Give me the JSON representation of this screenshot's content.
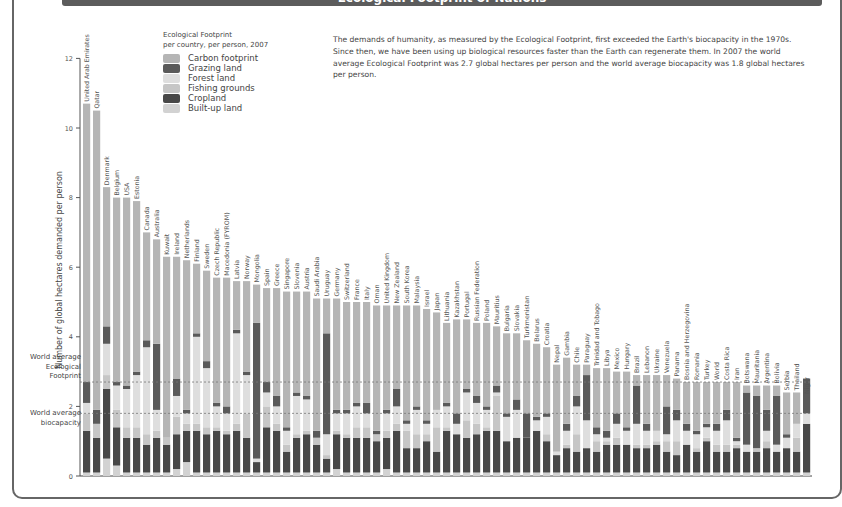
{
  "title": "Ecological Footprint of Nations",
  "legend": {
    "title_line1": "Ecological Footprint",
    "title_line2": "per country, per person, 2007",
    "items": [
      {
        "key": "carbon",
        "label": "Carbon footprint",
        "color": "#b5b5b5"
      },
      {
        "key": "grazing",
        "label": "Grazing land",
        "color": "#5a5a5a"
      },
      {
        "key": "forest",
        "label": "Forest land",
        "color": "#dedede"
      },
      {
        "key": "fishing",
        "label": "Fishing grounds",
        "color": "#c6c6c6"
      },
      {
        "key": "cropland",
        "label": "Cropland",
        "color": "#484848"
      },
      {
        "key": "builtup",
        "label": "Built-up land",
        "color": "#d2d2d2"
      }
    ]
  },
  "description": "The demands of humanity, as measured by the Ecological Footprint, first exceeded the Earth's biocapacity in the 1970s. Since then, we have been using up biological resources faster than the Earth can regenerate them. In 2007 the world average Ecological Footprint was 2.7 global hectares per person and the world average biocapacity was 1.8 global hectares per person.",
  "annotations": {
    "footprint_line": {
      "value": 2.7,
      "label_lines": [
        "World average",
        "Ecological",
        "Footprint"
      ]
    },
    "biocapacity_line": {
      "value": 1.8,
      "label_lines": [
        "World average",
        "biocapacity"
      ]
    }
  },
  "chart_data": {
    "type": "bar",
    "stacked": true,
    "title": "Ecological Footprint of Nations",
    "xlabel": "",
    "ylabel": "Number of global hectares demanded per person",
    "ylim": [
      0,
      12
    ],
    "yticks": [
      0,
      2,
      4,
      6,
      8,
      10,
      12
    ],
    "grid": false,
    "legend_position": "top-left",
    "reference_lines": [
      {
        "label": "World average Ecological Footprint",
        "value": 2.7
      },
      {
        "label": "World average biocapacity",
        "value": 1.8
      }
    ],
    "stack_order_bottom_to_top": [
      "builtup",
      "cropland",
      "fishing",
      "forest",
      "grazing",
      "carbon"
    ],
    "categories": [
      "United Arab Emirates",
      "Qatar",
      "Denmark",
      "Belgium",
      "USA",
      "Estonia",
      "Canada",
      "Australia",
      "Kuwait",
      "Ireland",
      "Netherlands",
      "Finland",
      "Sweden",
      "Czech Republic",
      "Macedonia (FYROM)",
      "Latvia",
      "Norway",
      "Mongolia",
      "Spain",
      "Greece",
      "Singapore",
      "Slovenia",
      "Austria",
      "Saudi Arabia",
      "Uruguay",
      "Germany",
      "Switzerland",
      "France",
      "Italy",
      "Oman",
      "United Kingdom",
      "New Zealand",
      "South Korea",
      "Malaysia",
      "Israel",
      "Japan",
      "Lithuania",
      "Kazakhstan",
      "Portugal",
      "Russian Federation",
      "Poland",
      "Mauritius",
      "Bulgaria",
      "Slovakia",
      "Turkmenistan",
      "Belarus",
      "Croatia",
      "Nepal",
      "Gambia",
      "Chile",
      "Paraguay",
      "Trinidad and Tobago",
      "Libya",
      "Mexico",
      "Hungary",
      "Brazil",
      "Lebanon",
      "Ukraine",
      "Venezuela",
      "Panama",
      "Bosnia and Herzegovina",
      "Romania",
      "Turkey",
      "World",
      "Costa Rica",
      "Iran",
      "Botswana",
      "Mauritania",
      "Argentina",
      "Bolivia",
      "Serbia",
      "Thailand",
      "Niger"
    ],
    "totals": [
      10.7,
      10.5,
      8.3,
      8.0,
      8.0,
      7.9,
      7.0,
      6.8,
      6.3,
      6.3,
      6.2,
      6.1,
      5.9,
      5.7,
      5.7,
      5.6,
      5.6,
      5.5,
      5.4,
      5.4,
      5.3,
      5.3,
      5.3,
      5.1,
      5.1,
      5.1,
      5.0,
      5.0,
      5.0,
      4.9,
      4.9,
      4.9,
      4.9,
      4.9,
      4.8,
      4.7,
      4.4,
      4.5,
      4.5,
      4.4,
      4.4,
      4.3,
      4.1,
      4.1,
      3.9,
      3.8,
      3.7,
      3.2,
      3.4,
      3.2,
      3.2,
      3.1,
      3.1,
      3.0,
      3.0,
      2.9,
      2.9,
      2.9,
      2.9,
      2.8,
      2.7,
      2.7,
      2.7,
      2.7,
      2.7,
      2.7,
      2.6,
      2.6,
      2.6,
      2.6,
      2.4,
      2.4,
      2.3
    ],
    "series": [
      {
        "name": "Built-up land",
        "key": "builtup",
        "values": [
          0.1,
          0.1,
          0.5,
          0.3,
          0.1,
          0.1,
          0.1,
          0.1,
          0.1,
          0.2,
          0.4,
          0.1,
          0.1,
          0.1,
          0.1,
          0.1,
          0.1,
          0.1,
          0.1,
          0.1,
          0.1,
          0.1,
          0.1,
          0.1,
          0.1,
          0.2,
          0.1,
          0.1,
          0.1,
          0.1,
          0.2,
          0.1,
          0.1,
          0.1,
          0.1,
          0.1,
          0.1,
          0.1,
          0.1,
          0.1,
          0.1,
          0.1,
          0.1,
          0.1,
          0.1,
          0.1,
          0.1,
          0.1,
          0.1,
          0.1,
          0.1,
          0.1,
          0.1,
          0.1,
          0.1,
          0.1,
          0.1,
          0.1,
          0.1,
          0.1,
          0.1,
          0.1,
          0.1,
          0.1,
          0.1,
          0.1,
          0.1,
          0.1,
          0.1,
          0.1,
          0.1,
          0.1,
          0.1
        ]
      },
      {
        "name": "Cropland",
        "key": "cropland",
        "values": [
          1.2,
          1.0,
          2.0,
          1.1,
          1.0,
          1.0,
          0.8,
          1.0,
          0.8,
          1.0,
          0.9,
          1.2,
          1.1,
          1.2,
          1.1,
          1.2,
          1.0,
          0.3,
          1.3,
          1.2,
          0.6,
          1.0,
          1.1,
          0.8,
          0.4,
          1.0,
          1.0,
          1.0,
          1.0,
          0.9,
          0.9,
          1.2,
          0.7,
          0.7,
          0.9,
          0.6,
          1.2,
          1.1,
          1.0,
          1.1,
          1.2,
          1.2,
          0.9,
          1.0,
          1.0,
          1.2,
          0.9,
          0.5,
          0.7,
          0.6,
          0.7,
          0.6,
          0.8,
          0.8,
          0.8,
          0.7,
          0.7,
          0.8,
          0.6,
          0.5,
          0.8,
          0.6,
          0.9,
          0.6,
          0.6,
          0.7,
          0.6,
          0.6,
          0.7,
          0.6,
          0.7,
          0.6,
          1.4
        ]
      },
      {
        "name": "Fishing grounds",
        "key": "fishing",
        "values": [
          0.5,
          0.4,
          0.4,
          0.5,
          0.3,
          0.3,
          0.3,
          0.2,
          0.2,
          0.5,
          0.2,
          0.2,
          0.2,
          0.1,
          0.1,
          0.2,
          0.7,
          0.0,
          0.6,
          0.2,
          0.2,
          0.1,
          0.1,
          0.2,
          0.1,
          0.1,
          0.1,
          0.3,
          0.3,
          0.2,
          0.2,
          0.2,
          0.5,
          0.4,
          0.2,
          0.7,
          0.1,
          0.0,
          0.5,
          0.3,
          0.1,
          1.0,
          0.0,
          0.0,
          0.0,
          0.0,
          0.2,
          0.0,
          0.1,
          0.5,
          0.0,
          0.3,
          0.1,
          0.2,
          0.0,
          0.1,
          0.1,
          0.1,
          0.3,
          0.4,
          0.0,
          0.1,
          0.1,
          0.2,
          0.2,
          0.1,
          0.0,
          0.1,
          0.2,
          0.0,
          0.0,
          0.4,
          0.0
        ]
      },
      {
        "name": "Forest land",
        "key": "forest",
        "values": [
          0.3,
          0.0,
          0.9,
          0.7,
          1.1,
          1.5,
          2.5,
          0.6,
          0.0,
          0.6,
          0.3,
          2.5,
          1.7,
          0.6,
          0.5,
          2.6,
          1.1,
          0.1,
          0.4,
          0.5,
          0.4,
          1.1,
          0.9,
          0.0,
          0.6,
          0.5,
          0.6,
          0.6,
          0.4,
          0.0,
          0.5,
          0.5,
          0.2,
          0.7,
          0.3,
          0.5,
          0.6,
          0.3,
          0.8,
          0.6,
          0.5,
          0.1,
          0.7,
          0.8,
          0.0,
          0.3,
          0.5,
          0.1,
          0.4,
          0.8,
          0.8,
          0.2,
          0.1,
          0.4,
          0.4,
          0.6,
          0.4,
          0.3,
          0.2,
          0.6,
          0.4,
          0.4,
          0.3,
          0.4,
          0.7,
          0.1,
          0.2,
          0.0,
          0.3,
          0.2,
          0.3,
          0.4,
          0.3
        ]
      },
      {
        "name": "Grazing land",
        "key": "grazing",
        "values": [
          0.6,
          0.4,
          0.5,
          0.1,
          0.1,
          0.1,
          0.2,
          1.9,
          0.0,
          0.5,
          0.1,
          0.1,
          0.2,
          0.1,
          0.2,
          0.1,
          0.1,
          3.9,
          0.3,
          0.3,
          0.1,
          0.1,
          0.1,
          0.2,
          2.9,
          0.1,
          0.1,
          0.1,
          0.3,
          0.1,
          0.1,
          0.5,
          0.1,
          0.1,
          0.1,
          0.0,
          0.1,
          0.3,
          0.1,
          0.2,
          0.1,
          0.2,
          0.1,
          0.3,
          0.7,
          0.1,
          0.1,
          0.0,
          0.2,
          0.3,
          1.3,
          0.2,
          0.2,
          0.3,
          0.1,
          1.1,
          0.2,
          0.0,
          0.8,
          0.3,
          0.2,
          0.1,
          0.1,
          0.2,
          0.3,
          0.1,
          1.5,
          1.5,
          0.6,
          1.4,
          0.1,
          0.0,
          1.0
        ]
      }
    ]
  },
  "axis": {
    "ytick_labels": [
      "0",
      "2",
      "4",
      "6",
      "8",
      "10",
      "12"
    ],
    "ylabel": "Number of global hectares demanded per person"
  }
}
